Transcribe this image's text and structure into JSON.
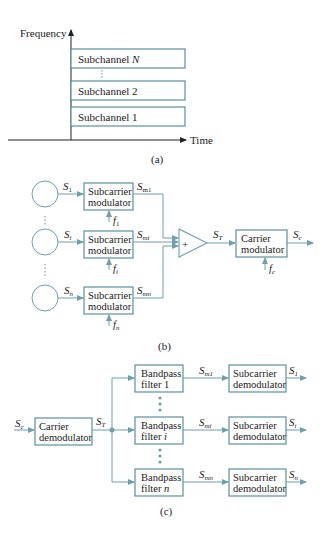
{
  "panel_a": {
    "y_axis_label": "Frequency",
    "x_axis_label": "Time",
    "subchannels": [
      {
        "label": "Subchannel ",
        "index": "N"
      },
      {
        "label": "Subchannel 2",
        "index": ""
      },
      {
        "label": "Subchannel 1",
        "index": ""
      }
    ],
    "caption": "(a)"
  },
  "panel_b": {
    "sources": [
      {
        "signal": "S",
        "sub": "1",
        "mod_line1": "Subcarrier",
        "mod_line2": "modulator",
        "freq": "f",
        "freq_sub": "1",
        "out": "S",
        "out_sub": "m1"
      },
      {
        "signal": "S",
        "sub": "i",
        "mod_line1": "Subcarrier",
        "mod_line2": "modulator",
        "freq": "f",
        "freq_sub": "i",
        "out": "S",
        "out_sub": "mi"
      },
      {
        "signal": "S",
        "sub": "n",
        "mod_line1": "Subcarrier",
        "mod_line2": "modulator",
        "freq": "f",
        "freq_sub": "n",
        "out": "S",
        "out_sub": "mn"
      }
    ],
    "summer_symbol": "+",
    "sum_out": "S",
    "sum_out_sub": "T",
    "carrier_line1": "Carrier",
    "carrier_line2": "modulator",
    "carrier_freq": "f",
    "carrier_freq_sub": "c",
    "final_out": "S",
    "final_out_sub": "c",
    "caption": "(b)"
  },
  "panel_c": {
    "input": "S",
    "input_sub": "c",
    "demod_line1": "Carrier",
    "demod_line2": "demodulator",
    "demod_out": "S",
    "demod_out_sub": "T",
    "branches": [
      {
        "bpf_line1": "Bandpass",
        "bpf_line2": "filter 1",
        "bpf_idx": "",
        "mid": "S",
        "mid_sub": "m1",
        "dem_line1": "Subcarrier",
        "dem_line2": "demodulator",
        "out": "S",
        "out_sub": "1"
      },
      {
        "bpf_line1": "Bandpass",
        "bpf_line2": "filter ",
        "bpf_idx": "i",
        "mid": "S",
        "mid_sub": "mi",
        "dem_line1": "Subcarrier",
        "dem_line2": "demodulator",
        "out": "S",
        "out_sub": "i"
      },
      {
        "bpf_line1": "Bandpass",
        "bpf_line2": "filter ",
        "bpf_idx": "n",
        "mid": "S",
        "mid_sub": "mn",
        "dem_line1": "Subcarrier",
        "dem_line2": "demodulator",
        "out": "S",
        "out_sub": "n"
      }
    ],
    "caption": "(c)"
  },
  "colors": {
    "line": "#6f9fae",
    "box_border": "#5b8fa0",
    "text": "#1a1a1a"
  }
}
